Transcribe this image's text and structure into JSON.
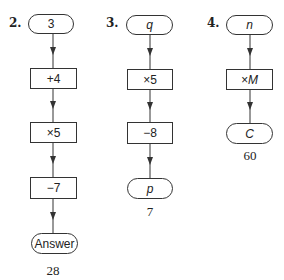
{
  "flowcharts": [
    {
      "number": "2.",
      "nodes": [
        {
          "shape": "terminal",
          "text": "3"
        },
        {
          "shape": "process",
          "text": "+4"
        },
        {
          "shape": "process",
          "text": "×5"
        },
        {
          "shape": "process",
          "text": "−7"
        },
        {
          "shape": "terminal",
          "text": "Answer"
        }
      ],
      "result": "28"
    },
    {
      "number": "3.",
      "nodes": [
        {
          "shape": "terminal",
          "text": "q"
        },
        {
          "shape": "process",
          "text": "×5"
        },
        {
          "shape": "process",
          "text": "−8"
        },
        {
          "shape": "terminal",
          "text": "p"
        }
      ],
      "result": "7"
    },
    {
      "number": "4.",
      "nodes": [
        {
          "shape": "terminal",
          "text": "n"
        },
        {
          "shape": "process",
          "text": "×M"
        },
        {
          "shape": "terminal",
          "text": "C"
        }
      ],
      "result": "60"
    }
  ],
  "colors": {
    "line": "#333333",
    "background": "#ffffff"
  }
}
